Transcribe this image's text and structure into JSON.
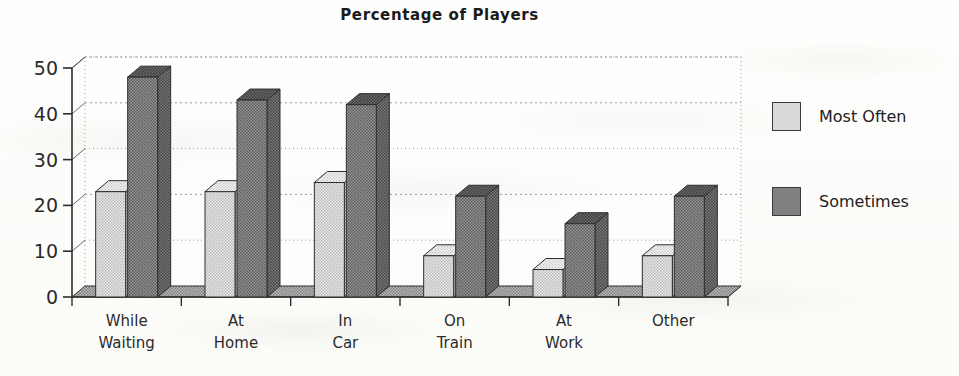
{
  "chart_data": {
    "type": "bar",
    "title": "Percentage of Players",
    "xlabel": "",
    "ylabel": "",
    "ylim": [
      0,
      50
    ],
    "yticks": [
      0,
      10,
      20,
      30,
      40,
      50
    ],
    "grid": true,
    "legend_position": "right",
    "style": "3d-extruded-bar",
    "categories": [
      "While Waiting",
      "At Home",
      "In Car",
      "On Train",
      "At Work",
      "Other"
    ],
    "category_lines": [
      [
        "While",
        "Waiting"
      ],
      [
        "At",
        "Home"
      ],
      [
        "In",
        "Car"
      ],
      [
        "On",
        "Train"
      ],
      [
        "At",
        "Work"
      ],
      [
        "Other",
        ""
      ]
    ],
    "series": [
      {
        "name": "Most Often",
        "color": "#d9d9d9",
        "values": [
          23,
          23,
          25,
          9,
          6,
          9
        ]
      },
      {
        "name": "Sometimes",
        "color": "#808080",
        "values": [
          48,
          43,
          42,
          22,
          16,
          22
        ]
      }
    ]
  },
  "legend": {
    "items": [
      {
        "label": "Most Often",
        "color": "#d9d9d9"
      },
      {
        "label": "Sometimes",
        "color": "#808080"
      }
    ]
  },
  "colors": {
    "background": "#fdfdfb",
    "axis": "#3a3a3a",
    "gridline": "#8d8d8d",
    "text": "#1a1a1a",
    "series_light": "#d9d9d9",
    "series_dark": "#808080"
  }
}
